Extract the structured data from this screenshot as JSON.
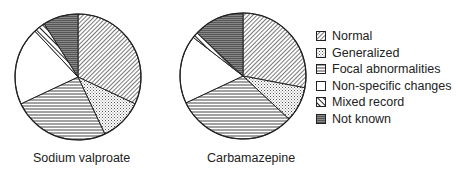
{
  "chart_data": [
    {
      "type": "pie",
      "title": "Sodium valproate",
      "categories": [
        "Normal",
        "Generalized",
        "Focal abnormalities",
        "Non-specific changes",
        "Mixed record",
        "Not known"
      ],
      "values": [
        32,
        11,
        25,
        20,
        3,
        9
      ],
      "start_angle_deg": 0,
      "direction": "clockwise"
    },
    {
      "type": "pie",
      "title": "Carbamazepine",
      "categories": [
        "Normal",
        "Generalized",
        "Focal abnormalities",
        "Non-specific changes",
        "Mixed record",
        "Not known"
      ],
      "values": [
        28,
        9,
        31,
        17.5,
        1.5,
        13
      ],
      "start_angle_deg": 0,
      "direction": "clockwise"
    }
  ],
  "legend": {
    "position": "right",
    "items": [
      {
        "label": "Normal",
        "pattern": "diag-dense"
      },
      {
        "label": "Generalized",
        "pattern": "dots"
      },
      {
        "label": "Focal abnormalities",
        "pattern": "hlines"
      },
      {
        "label": "Non-specific changes",
        "pattern": "blank"
      },
      {
        "label": "Mixed record",
        "pattern": "diag-bold"
      },
      {
        "label": "Not known",
        "pattern": "hlines-dark"
      }
    ]
  },
  "labels": {
    "left": "Sodium valproate",
    "right": "Carbamazepine"
  }
}
